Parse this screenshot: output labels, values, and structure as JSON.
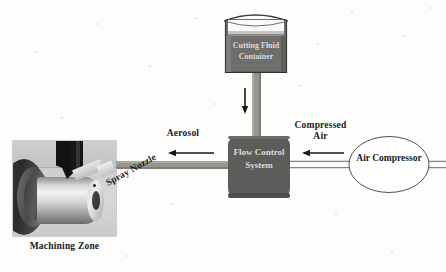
{
  "diagram": {
    "nodes": [
      {
        "id": "cutting-fluid-container",
        "label": "Cutting\nFluid\nContainer",
        "shape": "open-top-tank",
        "fill": "#6e6e6c",
        "text_color": "#d9d9d7"
      },
      {
        "id": "flow-control-system",
        "label": "Flow\nControl\nSystem",
        "shape": "rounded-rectangle",
        "fill": "#5c5c5a",
        "text_color": "#dcdcda"
      },
      {
        "id": "air-compressor",
        "label": "Air\nCompressor",
        "shape": "ellipse",
        "fill": "#ffffff",
        "text_color": "#1a1a1a"
      },
      {
        "id": "machining-zone",
        "label": "Machining Zone",
        "shape": "photograph",
        "text_color": "#1a1a1a"
      }
    ],
    "flows": [
      {
        "id": "fluid-feed",
        "label": "",
        "from": "cutting-fluid-container",
        "to": "flow-control-system",
        "direction": "down",
        "pipe_style": "solid-gray"
      },
      {
        "id": "compressed-air-line",
        "label": "Compressed\nAir",
        "from": "air-compressor",
        "to": "flow-control-system",
        "direction": "left",
        "pipe_style": "thin-outline"
      },
      {
        "id": "aerosol-line",
        "label": "Aerosol",
        "from": "flow-control-system",
        "to": "machining-zone",
        "direction": "left",
        "pipe_style": "solid-gray"
      }
    ],
    "annotations": [
      {
        "id": "spray-nozzle",
        "label": "Spray Nozzle",
        "rotation_deg": -29
      }
    ],
    "colors": {
      "background": "#fdfdfc",
      "pipe_gray": "#8f8f8d",
      "node_dark": "#5c5c5a",
      "node_mid": "#6e6e6c",
      "outline": "#3a3a38",
      "label_text": "#1a1a1a"
    }
  }
}
